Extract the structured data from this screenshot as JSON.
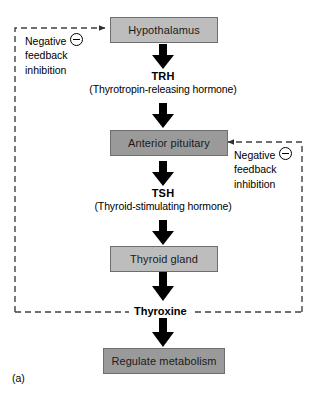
{
  "figure": {
    "caption": "(a)",
    "background_color": "#ffffff"
  },
  "colors": {
    "node_light": "#bdbdbd",
    "node_dark": "#9a9a9a",
    "node_border": "#6e6e6e",
    "arrow": "#000000",
    "dashed_line": "#404040",
    "text": "#000000"
  },
  "nodes": [
    {
      "id": "hypothalamus",
      "label": "Hypothalamus",
      "shade": "light"
    },
    {
      "id": "anterior-pituitary",
      "label": "Anterior pituitary",
      "shade": "dark"
    },
    {
      "id": "thyroid-gland",
      "label": "Thyroid gland",
      "shade": "light"
    },
    {
      "id": "regulate-metabolism",
      "label": "Regulate metabolism",
      "shade": "dark"
    }
  ],
  "hormones": [
    {
      "id": "trh",
      "abbr": "TRH",
      "full_name": "(Thyrotropin-releasing hormone)"
    },
    {
      "id": "tsh",
      "abbr": "TSH",
      "full_name": "(Thyroid-stimulating hormone)"
    }
  ],
  "thyroxine": {
    "label": "Thyroxine"
  },
  "feedback_loops": [
    {
      "id": "feedback-left",
      "line1": "Negative",
      "line2": "feedback",
      "line3": "inhibition",
      "sign": "minus-circle",
      "target": "hypothalamus"
    },
    {
      "id": "feedback-right",
      "line1": "Negative",
      "line2": "feedback",
      "line3": "inhibition",
      "sign": "minus-circle",
      "target": "anterior-pituitary"
    }
  ]
}
